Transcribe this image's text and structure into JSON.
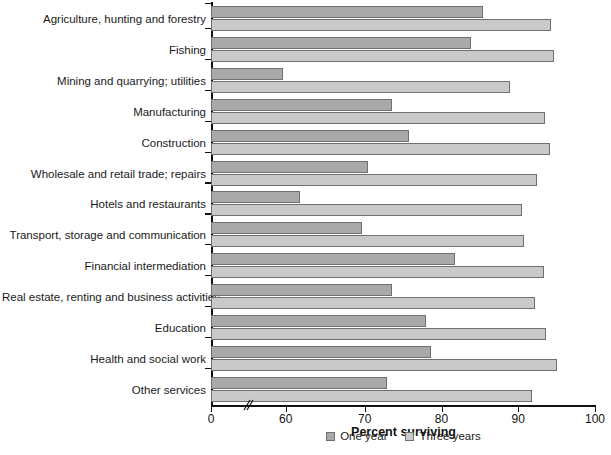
{
  "chart_data": {
    "type": "bar",
    "orientation": "horizontal",
    "title": "",
    "xlabel": "Percent surviving",
    "ylabel": "",
    "xlim": [
      0,
      100
    ],
    "x_ticks": [
      0,
      60,
      70,
      80,
      90,
      100
    ],
    "x_tick_labels": [
      "0",
      "60",
      "70",
      "80",
      "90",
      "100"
    ],
    "axis_break": true,
    "axis_break_between": [
      0,
      60
    ],
    "grid": false,
    "legend_position": "bottom-center",
    "categories": [
      "Agriculture, hunting and forestry",
      "Fishing",
      "Mining and quarrying; utilities",
      "Manufacturing",
      "Construction",
      "Wholesale and retail trade; repairs",
      "Hotels and restaurants",
      "Transport, storage and communication",
      "Financial intermediation",
      "Real estate, renting and business activities",
      "Education",
      "Health and social work",
      "Other services"
    ],
    "series": [
      {
        "name": "One year",
        "color": "#a9a9a9",
        "values": [
          85.4,
          83.8,
          57.5,
          73.5,
          75.8,
          70.4,
          61.5,
          69.7,
          81.7,
          73.6,
          78.0,
          78.6,
          72.9
        ]
      },
      {
        "name": "Three years",
        "color": "#c9c9c9",
        "values": [
          94.3,
          94.7,
          88.9,
          93.5,
          94.2,
          92.4,
          90.5,
          90.7,
          93.3,
          92.2,
          93.6,
          95.1,
          91.8
        ]
      }
    ]
  },
  "legend": {
    "items": [
      {
        "label": "One year",
        "color": "#a9a9a9"
      },
      {
        "label": "Three years",
        "color": "#c9c9c9"
      }
    ]
  },
  "axis": {
    "x_title": "Percent surviving"
  },
  "caption": ""
}
